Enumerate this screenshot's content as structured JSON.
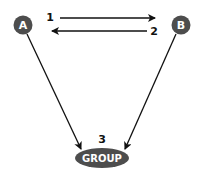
{
  "diagram": {
    "type": "flow",
    "colors": {
      "node_fill": "#4d4d4d",
      "node_text": "#ffffff",
      "edge": "#111111",
      "background": "#ffffff"
    },
    "nodes": [
      {
        "id": "A",
        "label": "A",
        "shape": "circle"
      },
      {
        "id": "B",
        "label": "B",
        "shape": "circle"
      },
      {
        "id": "GROUP",
        "label": "GROUP",
        "shape": "ellipse"
      }
    ],
    "edges": [
      {
        "from": "A",
        "to": "B",
        "step": "1"
      },
      {
        "from": "B",
        "to": "A",
        "step": "2"
      },
      {
        "from": "A",
        "to": "GROUP",
        "step": "3"
      },
      {
        "from": "B",
        "to": "GROUP",
        "step": "3"
      }
    ],
    "step_labels": [
      "1",
      "2",
      "3"
    ]
  }
}
